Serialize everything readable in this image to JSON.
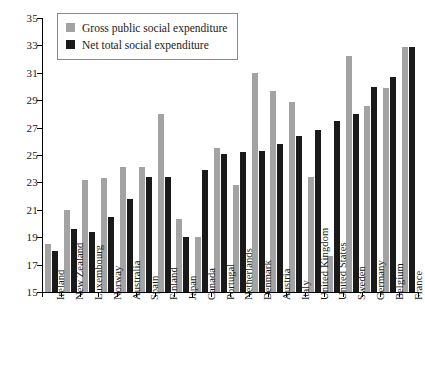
{
  "chart_data": {
    "type": "bar",
    "title": "",
    "subtitle": "",
    "xlabel": "",
    "ylabel": "",
    "ylim": [
      15,
      35
    ],
    "ytick_step": 2,
    "yticks": [
      15,
      17,
      19,
      21,
      23,
      25,
      27,
      29,
      31,
      33,
      35
    ],
    "grid": false,
    "legend_position": "top-left",
    "categories": [
      "Ireland",
      "New Zealand",
      "Luxembourg",
      "Norway",
      "Australia",
      "Spain",
      "Finland",
      "Japan",
      "Canada",
      "Portugal",
      "Netherlands",
      "Denmark",
      "Austria",
      "Italy",
      "United Kingdom",
      "United States",
      "Sweden",
      "Germany",
      "Belgium",
      "France"
    ],
    "series": [
      {
        "name": "Gross public social expenditure",
        "color": "#a3a3a3",
        "values": [
          18.5,
          21.0,
          23.2,
          23.3,
          24.1,
          24.1,
          28.0,
          20.3,
          19.0,
          25.5,
          22.8,
          31.0,
          29.7,
          28.9,
          23.4,
          17.6,
          32.2,
          28.6,
          29.9,
          32.9
        ]
      },
      {
        "name": "Net total social expenditure",
        "color": "#1a1a1a",
        "values": [
          18.0,
          19.6,
          19.4,
          20.5,
          21.8,
          23.4,
          23.4,
          19.0,
          23.9,
          25.1,
          25.2,
          25.3,
          25.8,
          26.4,
          26.8,
          27.5,
          28.0,
          30.0,
          30.7,
          32.9
        ]
      }
    ],
    "legend": [
      "Gross public social expenditure",
      "Net total social expenditure"
    ]
  }
}
